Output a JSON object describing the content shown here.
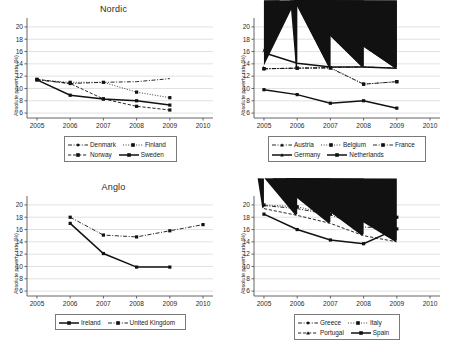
{
  "figure": {
    "ylabel": "Absolute poverty rate (%)",
    "yticks": [
      6,
      8,
      10,
      12,
      14,
      16,
      18,
      20
    ],
    "xticks": [
      2005,
      2006,
      2007,
      2008,
      2009,
      2010
    ],
    "ylim": [
      5.2,
      20.8
    ],
    "xlim": [
      2004.7,
      2010.3
    ]
  },
  "panels": [
    {
      "title": "Nordic",
      "legend": [
        {
          "label": "Denmark",
          "style": "dashdot",
          "marker": "diamond"
        },
        {
          "label": "Finland",
          "style": "dotted",
          "marker": "square"
        },
        {
          "label": "Norway",
          "style": "dashed",
          "marker": "square"
        },
        {
          "label": "Sweden",
          "style": "solid",
          "marker": "square"
        }
      ],
      "chart_data": {
        "type": "line",
        "title": "Nordic",
        "xlabel": "",
        "ylabel": "Absolute poverty rate (%)",
        "xlim": [
          2004.7,
          2010.3
        ],
        "ylim": [
          5.2,
          20.8
        ],
        "grid": true,
        "legend_position": "below",
        "x": [
          2005,
          2006,
          2007,
          2008,
          2009
        ],
        "series": [
          {
            "name": "Denmark",
            "values": [
              11.4,
              10.8,
              11.0,
              11.1,
              11.6
            ]
          },
          {
            "name": "Finland",
            "values": [
              11.4,
              11.0,
              11.0,
              9.4,
              8.5
            ]
          },
          {
            "name": "Norway",
            "values": [
              11.5,
              10.8,
              8.3,
              7.1,
              6.5
            ]
          },
          {
            "name": "Sweden",
            "values": [
              11.4,
              8.9,
              8.3,
              8.0,
              7.3
            ]
          }
        ]
      }
    },
    {
      "title": "Western Europe",
      "legend": [
        {
          "label": "Austria",
          "style": "dashdot",
          "marker": "triangle"
        },
        {
          "label": "Belgium",
          "style": "dotted",
          "marker": "square"
        },
        {
          "label": "France",
          "style": "dashdot",
          "marker": "square"
        },
        {
          "label": "Germany",
          "style": "solid",
          "marker": "triangle"
        },
        {
          "label": "Netherlands",
          "style": "solid",
          "marker": "square"
        }
      ],
      "chart_data": {
        "type": "line",
        "title": "Western Europe",
        "xlabel": "",
        "ylabel": "Absolute poverty rate (%)",
        "xlim": [
          2004.7,
          2010.3
        ],
        "ylim": [
          5.2,
          20.8
        ],
        "grid": true,
        "legend_position": "below",
        "x": [
          2005,
          2006,
          2007,
          2008,
          2009
        ],
        "series": [
          {
            "name": "Austria",
            "values": [
              13.2,
              13.3,
              13.4,
              13.5,
              13.3
            ]
          },
          {
            "name": "Belgium",
            "values": [
              13.2,
              13.3,
              13.4,
              10.7,
              11.1
            ]
          },
          {
            "name": "France",
            "values": [
              13.2,
              13.3,
              13.3,
              10.7,
              11.1
            ]
          },
          {
            "name": "Germany",
            "values": [
              15.8,
              14.1,
              13.5,
              13.5,
              13.3
            ]
          },
          {
            "name": "Netherlands",
            "values": [
              9.8,
              9.0,
              7.6,
              8.0,
              6.8
            ]
          }
        ]
      }
    },
    {
      "title": "Anglo",
      "legend": [
        {
          "label": "Ireland",
          "style": "solid",
          "marker": "square"
        },
        {
          "label": "United Kingdom",
          "style": "dashdot",
          "marker": "square"
        }
      ],
      "chart_data": {
        "type": "line",
        "title": "Anglo",
        "xlabel": "",
        "ylabel": "Absolute poverty rate (%)",
        "xlim": [
          2004.7,
          2010.3
        ],
        "ylim": [
          5.2,
          20.8
        ],
        "grid": true,
        "legend_position": "below",
        "x": [
          2006,
          2007,
          2008,
          2009,
          2010
        ],
        "series": [
          {
            "name": "Ireland",
            "values": [
              17.0,
              12.1,
              9.9,
              9.9,
              null
            ]
          },
          {
            "name": "United Kingdom",
            "values": [
              18.0,
              15.1,
              14.8,
              15.8,
              16.8
            ]
          }
        ]
      }
    },
    {
      "title": "Southern Europe",
      "legend": [
        {
          "label": "Greece",
          "style": "dashdot",
          "marker": "diamond"
        },
        {
          "label": "Italy",
          "style": "dotted",
          "marker": "square"
        },
        {
          "label": "Portugal",
          "style": "dashed",
          "marker": "triangle"
        },
        {
          "label": "Spain",
          "style": "solid",
          "marker": "square"
        }
      ],
      "chart_data": {
        "type": "line",
        "title": "Southern Europe",
        "xlabel": "",
        "ylabel": "Absolute poverty rate (%)",
        "xlim": [
          2004.7,
          2010.3
        ],
        "ylim": [
          5.2,
          20.8
        ],
        "grid": true,
        "legend_position": "below",
        "x": [
          2005,
          2006,
          2007,
          2008,
          2009
        ],
        "series": [
          {
            "name": "Greece",
            "values": [
              19.9,
              19.4,
              18.4,
              16.4,
              16.2
            ]
          },
          {
            "name": "Italy",
            "values": [
              20.0,
              19.7,
              18.5,
              18.2,
              18.0
            ]
          },
          {
            "name": "Portugal",
            "values": [
              19.4,
              18.3,
              17.0,
              15.0,
              14.0
            ]
          },
          {
            "name": "Spain",
            "values": [
              18.5,
              16.0,
              14.3,
              13.7,
              16.1
            ]
          }
        ]
      }
    }
  ]
}
